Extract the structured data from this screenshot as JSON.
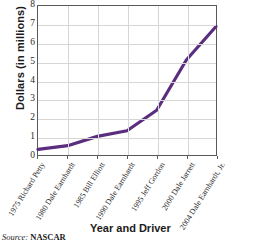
{
  "chart_data": {
    "type": "line",
    "title": "",
    "xlabel": "Year and Driver",
    "ylabel": "Dollars (in millions)",
    "ylim": [
      0,
      8
    ],
    "yticks": [
      0,
      1,
      2,
      3,
      4,
      5,
      6,
      7,
      8
    ],
    "ytick_labels": [
      "0",
      "1",
      "2",
      "3",
      "4",
      "5",
      "6",
      "7",
      "8"
    ],
    "grid": true,
    "legend": "none",
    "categories": [
      "1975 Richard Petty",
      "1980 Dale Earnhardt",
      "1985 Bill Elliott",
      "1990 Dale Earnhardt",
      "1995 Jeff Gordon",
      "2000 Dale Jarrett",
      "2004 Dale Earnhardt, Jr."
    ],
    "years": [
      "1975",
      "1980",
      "1985",
      "1990",
      "1995",
      "2000",
      "2004"
    ],
    "drivers": [
      "Richard Petty",
      "Dale Earnhardt",
      "Bill Elliott",
      "Dale Earnhardt",
      "Jeff Gordon",
      "Dale Jarrett",
      "Dale Earnhardt, Jr."
    ],
    "values": [
      0.3,
      0.5,
      1.0,
      1.3,
      2.4,
      5.1,
      6.9
    ],
    "series": [
      {
        "name": "Winnings",
        "values": [
          0.3,
          0.5,
          1.0,
          1.3,
          2.4,
          5.1,
          6.9
        ]
      }
    ],
    "line_color": "#5b2d7e",
    "grid_color": "#d6d6d6",
    "frame_color": "#595959"
  },
  "source": {
    "label": "Source:",
    "organization": "NASCAR"
  }
}
